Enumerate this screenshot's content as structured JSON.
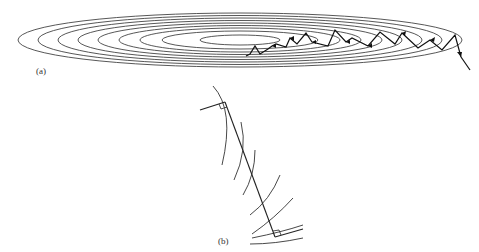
{
  "figure": {
    "panel_a": {
      "label": "(a)",
      "description": "Concentric elongated elliptical contours with a zig-zag path of steepest-descent steps converging toward the center",
      "ellipse_count": 9,
      "stroke_color": "#444444",
      "path_color": "#111111"
    },
    "panel_b": {
      "label": "(b)",
      "description": "Magnified view: a line segment crossing contour arcs, with right-angle markers at both ends where it meets tangent lines",
      "stroke_color": "#222222"
    }
  }
}
